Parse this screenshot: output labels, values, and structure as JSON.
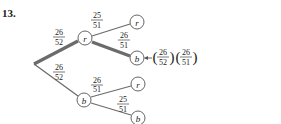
{
  "problem_number": "13.",
  "tree": {
    "root_branches": [
      {
        "prob_num": "26",
        "prob_den": "52",
        "node": "r"
      },
      {
        "prob_num": "26",
        "prob_den": "52",
        "node": "b"
      }
    ],
    "r_branches": [
      {
        "prob_num": "25",
        "prob_den": "51",
        "node": "r"
      },
      {
        "prob_num": "26",
        "prob_den": "51",
        "node": "b"
      }
    ],
    "b_branches": [
      {
        "prob_num": "26",
        "prob_den": "51",
        "node": "r"
      },
      {
        "prob_num": "25",
        "prob_den": "51",
        "node": "b"
      }
    ]
  },
  "result": {
    "f1_num": "26",
    "f1_den": "52",
    "f2_num": "26",
    "f2_den": "51"
  },
  "colors": {
    "line": "#6b6b6b",
    "highlight": "#6b6b6b",
    "text": "#222222"
  }
}
